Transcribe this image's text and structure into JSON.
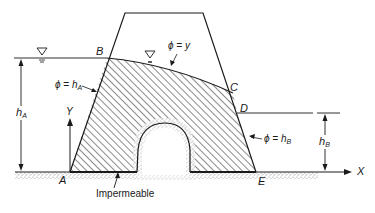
{
  "diagram": {
    "points": {
      "A": "A",
      "B": "B",
      "C": "C",
      "D": "D",
      "E": "E"
    },
    "axes": {
      "x": "X",
      "y": "Y"
    },
    "boundary_conditions": {
      "phatic_line": "ϕ = y",
      "upstream_face_phi": "ϕ =",
      "upstream_face_h": "h",
      "upstream_face_sub": "A",
      "downstream_face_phi": "ϕ =",
      "downstream_face_h": "h",
      "downstream_face_sub": "B"
    },
    "dimensions": {
      "headwater_h": "h",
      "headwater_sub": "A",
      "tailwater_h": "h",
      "tailwater_sub": "B"
    },
    "annotations": {
      "impermeable": "Impermeable"
    },
    "colors": {
      "line": "#1a1a1a",
      "hatch": "#2a2a2a",
      "soil_stipple": "#8a8a8a"
    }
  }
}
